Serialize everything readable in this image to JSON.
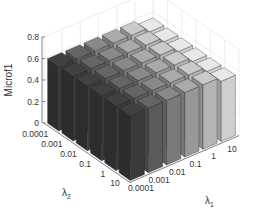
{
  "chart_data": {
    "type": "bar3d",
    "title": "",
    "xlabel": "λ1",
    "ylabel": "λ2",
    "zlabel": "Microf1",
    "x_categories": [
      "0.0001",
      "0.001",
      "0.01",
      "0.1",
      "1",
      "10"
    ],
    "y_categories": [
      "0.0001",
      "0.001",
      "0.01",
      "0.1",
      "1",
      "10"
    ],
    "z_ticks": [
      "0",
      "0.2",
      "0.4",
      "0.6",
      "0.8"
    ],
    "zlim": [
      0,
      0.8
    ],
    "grid": true,
    "values": [
      [
        0.6,
        0.6,
        0.6,
        0.6,
        0.6,
        0.56
      ],
      [
        0.6,
        0.6,
        0.6,
        0.6,
        0.6,
        0.56
      ],
      [
        0.6,
        0.6,
        0.6,
        0.6,
        0.6,
        0.56
      ],
      [
        0.6,
        0.6,
        0.6,
        0.6,
        0.6,
        0.56
      ],
      [
        0.6,
        0.6,
        0.6,
        0.6,
        0.6,
        0.56
      ],
      [
        0.6,
        0.6,
        0.6,
        0.6,
        0.6,
        0.56
      ]
    ],
    "values_note_rows": "rows indexed by λ2 (0.0001..10), columns by λ1 (0.0001..10)",
    "column_colors": [
      "#3a3a3a",
      "#5a5a5a",
      "#7a7a7a",
      "#989898",
      "#b4b4b4",
      "#cfcfcf"
    ]
  },
  "labels": {
    "zlabel": "Microf1",
    "xlabel_main": "λ",
    "xlabel_sub": "1",
    "ylabel_main": "λ",
    "ylabel_sub": "2"
  }
}
